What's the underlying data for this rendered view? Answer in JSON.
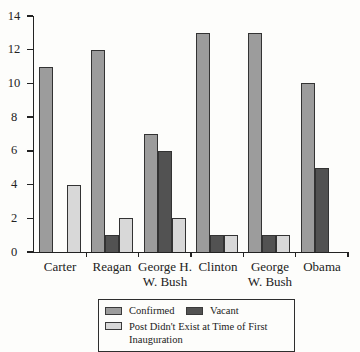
{
  "chart_data": {
    "type": "bar",
    "title": "",
    "xlabel": "",
    "ylabel": "",
    "categories": [
      "Carter",
      "Reagan",
      "George H.\nW. Bush",
      "Clinton",
      "George\nW. Bush",
      "Obama"
    ],
    "series": [
      {
        "key": "confirmed",
        "name": "Confirmed",
        "color": "#9c9c9c",
        "values": [
          11,
          12,
          7,
          13,
          13,
          10
        ]
      },
      {
        "key": "vacant",
        "name": "Vacant",
        "color": "#525252",
        "values": [
          0,
          1,
          6,
          1,
          1,
          5
        ]
      },
      {
        "key": "post-didnt-exist",
        "name": "Post Didn't Exist at Time of First Inauguration",
        "color": "#d8d8d8",
        "values": [
          4,
          2,
          2,
          1,
          1,
          0
        ]
      }
    ],
    "ylim": [
      0,
      14
    ],
    "yticks": [
      0,
      2,
      4,
      6,
      8,
      10,
      12,
      14
    ],
    "grid": false,
    "legend_position": "bottom",
    "bar_border_color": "#333333",
    "axis_color": "#222222",
    "background": "#fdfdfb"
  }
}
